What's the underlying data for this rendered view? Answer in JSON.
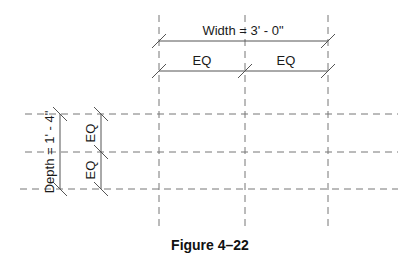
{
  "diagram": {
    "width_dimension": {
      "label": "Width = 3' - 0\""
    },
    "width_segments": [
      {
        "label": "EQ"
      },
      {
        "label": "EQ"
      }
    ],
    "depth_dimension": {
      "label": "Depth = 1' - 4\""
    },
    "depth_segments": [
      {
        "label": "EQ"
      },
      {
        "label": "EQ"
      }
    ],
    "grid": {
      "vertical_lines_x": [
        159,
        245,
        328
      ],
      "horizontal_lines_y": [
        114,
        152,
        189
      ]
    },
    "line_color": "#555555",
    "dash_color": "#777777"
  },
  "caption": {
    "label": "Figure 4–22"
  }
}
